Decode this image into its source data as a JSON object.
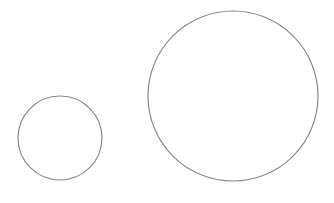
{
  "diagram": {
    "title": "",
    "shapes": [
      {
        "id": "small-circle",
        "type": "circle",
        "label": ""
      },
      {
        "id": "large-circle",
        "type": "circle",
        "label": ""
      }
    ],
    "stroke_color": "#8a8a8a",
    "background": "#ffffff"
  }
}
